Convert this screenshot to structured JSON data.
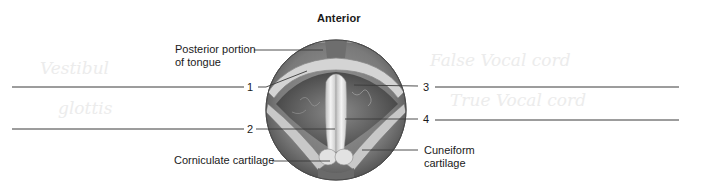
{
  "diagram": {
    "title": "Anterior",
    "labels": {
      "posterior_tongue_line1": "Posterior portion",
      "posterior_tongue_line2": "of tongue",
      "corniculate": "Corniculate cartilage",
      "cuneiform_line1": "Cuneiform",
      "cuneiform_line2": "cartilage"
    },
    "blanks": [
      {
        "number": "1",
        "side": "left",
        "answer": ""
      },
      {
        "number": "2",
        "side": "left",
        "answer": ""
      },
      {
        "number": "3",
        "side": "right",
        "answer": ""
      },
      {
        "number": "4",
        "side": "right",
        "answer": ""
      }
    ],
    "ghost_text": {
      "left_1": "Vestibul",
      "left_2": "glottis",
      "right_1": "False Vocal cord",
      "right_2": "True Vocal cord"
    },
    "colors": {
      "line": "#3a3a3a",
      "circle_outer": "#7d7d7d",
      "circle_inner": "#5a5a5a",
      "cords": "#e6e6e6",
      "ghost": "#ececec"
    }
  }
}
